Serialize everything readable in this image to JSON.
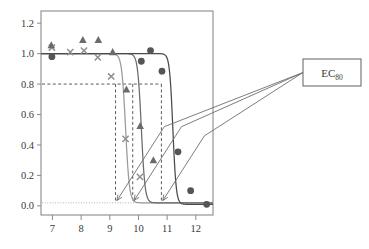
{
  "figure": {
    "kind": "dose-response-figure",
    "annotation": {
      "label": "EC",
      "subscript": "80"
    }
  },
  "chart_data": {
    "type": "line",
    "title": "",
    "xlabel": "",
    "ylabel": "",
    "xlim": [
      6.6,
      12.6
    ],
    "ylim": [
      -0.06,
      1.28
    ],
    "xticks": [
      7,
      8,
      9,
      10,
      11,
      12
    ],
    "xticklabels": [
      "7",
      "8",
      "9",
      "10",
      "11",
      "12"
    ],
    "yticks": [
      0.0,
      0.2,
      0.4,
      0.6,
      0.8,
      1.0,
      1.2
    ],
    "yticklabels": [
      "0.0",
      "0.2",
      "0.4",
      "0.6",
      "0.8",
      "1.0",
      "1.2"
    ],
    "grid": false,
    "legend": "none",
    "colors": {
      "marker_dark": "#555555",
      "marker_mid": "#6b6b6b",
      "marker_light": "#8f8f8f",
      "curve_dark": "#4a4a4a",
      "curve_mid": "#6b6b6b",
      "curve_light": "#9a9a9a",
      "frame": "#8a8a8a",
      "guide": "#4a4a4a",
      "baseline": "#a8a8a8",
      "annotation_stroke": "#6e6e6e",
      "text": "#3a3a3a"
    },
    "reference_line": {
      "y": 0.8,
      "style": "dashed",
      "label": "EC80 level"
    },
    "baseline_line": {
      "y": 0.02,
      "style": "dotted"
    },
    "ec80_values": [
      9.2,
      9.8,
      10.8
    ],
    "series": [
      {
        "name": "series-x",
        "marker": "x",
        "color": "#8f8f8f",
        "curve_color": "#9a9a9a",
        "ec80": 9.2,
        "curve": {
          "model": "logistic",
          "top": 1.0,
          "bottom": 0.02,
          "ec50": 9.55,
          "hill": 6.5
        },
        "points": [
          {
            "x": 6.98,
            "y": 1.04
          },
          {
            "x": 7.62,
            "y": 1.01
          },
          {
            "x": 8.1,
            "y": 1.02
          },
          {
            "x": 8.58,
            "y": 0.975
          },
          {
            "x": 9.05,
            "y": 0.85
          },
          {
            "x": 9.55,
            "y": 0.44
          },
          {
            "x": 10.05,
            "y": 0.19
          }
        ]
      },
      {
        "name": "series-triangle",
        "marker": "triangle",
        "color": "#6b6b6b",
        "curve_color": "#6b6b6b",
        "ec80": 9.8,
        "curve": {
          "model": "logistic",
          "top": 1.0,
          "bottom": 0.02,
          "ec50": 10.1,
          "hill": 6.8
        },
        "points": [
          {
            "x": 6.96,
            "y": 1.055
          },
          {
            "x": 8.06,
            "y": 1.09
          },
          {
            "x": 8.6,
            "y": 1.09
          },
          {
            "x": 9.1,
            "y": 1.01
          },
          {
            "x": 9.58,
            "y": 0.765
          },
          {
            "x": 10.06,
            "y": 0.525
          },
          {
            "x": 10.52,
            "y": 0.3
          }
        ]
      },
      {
        "name": "series-circle",
        "marker": "circle",
        "color": "#555555",
        "curve_color": "#4a4a4a",
        "ec80": 10.8,
        "curve": {
          "model": "logistic",
          "top": 1.0,
          "bottom": 0.01,
          "ec50": 11.2,
          "hill": 7.5
        },
        "points": [
          {
            "x": 6.98,
            "y": 0.98
          },
          {
            "x": 10.1,
            "y": 0.95
          },
          {
            "x": 10.42,
            "y": 1.02
          },
          {
            "x": 10.82,
            "y": 0.885
          },
          {
            "x": 11.38,
            "y": 0.355
          },
          {
            "x": 11.82,
            "y": 0.1
          },
          {
            "x": 12.38,
            "y": 0.01
          }
        ]
      }
    ],
    "arrows": [
      {
        "from_x": 10.9,
        "from_y": 0.52,
        "to_x": 9.25,
        "to_y": 0.035
      },
      {
        "from_x": 11.5,
        "from_y": 0.52,
        "to_x": 9.85,
        "to_y": 0.035
      },
      {
        "from_x": 12.3,
        "from_y": 0.46,
        "to_x": 10.85,
        "to_y": 0.035
      }
    ]
  }
}
